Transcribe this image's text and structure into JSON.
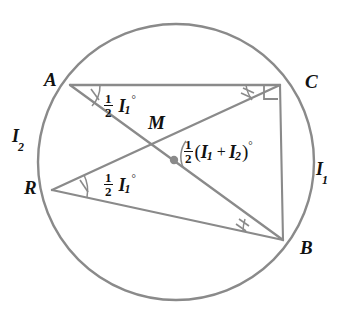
{
  "figure": {
    "background_color": "#ffffff",
    "stroke_color": "#8a8a8a",
    "text_color": "#111111",
    "circle": {
      "cx": 176,
      "cy": 162,
      "r": 138
    }
  },
  "points": {
    "A": {
      "label": "A",
      "x": 70,
      "y": 85,
      "label_x": 44,
      "label_y": 70
    },
    "C": {
      "label": "C",
      "x": 280,
      "y": 85,
      "label_x": 305,
      "label_y": 72
    },
    "R": {
      "label": "R",
      "x": 52,
      "y": 190,
      "label_x": 24,
      "label_y": 178
    },
    "B": {
      "label": "B",
      "x": 283,
      "y": 240,
      "label_x": 300,
      "label_y": 238
    },
    "M": {
      "label": "M",
      "x": 174,
      "y": 160,
      "label_x": 148,
      "label_y": 113
    }
  },
  "chords": [
    {
      "name": "chord-AC",
      "from": "A",
      "to": "C"
    },
    {
      "name": "chord-AB",
      "from": "A",
      "to": "B"
    },
    {
      "name": "chord-RC",
      "from": "R",
      "to": "C"
    },
    {
      "name": "chord-RB",
      "from": "R",
      "to": "B"
    },
    {
      "name": "chord-CB",
      "from": "C",
      "to": "B"
    }
  ],
  "labels": {
    "angle_A": {
      "text": "1/2 I1 degrees",
      "half_num": "1",
      "half_den": "2",
      "variable": "I",
      "subscript": "1",
      "degree": "°",
      "x": 104,
      "y": 99
    },
    "angle_R": {
      "text": "1/2 I1 degrees",
      "half_num": "1",
      "half_den": "2",
      "variable": "I",
      "subscript": "1",
      "degree": "°",
      "x": 104,
      "y": 178
    },
    "angle_M": {
      "text": "1/2 (I1 + I2) degrees",
      "half_num": "1",
      "half_den": "2",
      "open_paren": "(",
      "variable1": "I",
      "subscript1": "1",
      "plus": "+",
      "variable2": "I",
      "subscript2": "2",
      "close_paren": ")",
      "degree": "°",
      "x": 184,
      "y": 145
    },
    "arc_right": {
      "variable": "I",
      "subscript": "1",
      "x": 316,
      "y": 160
    },
    "arc_left": {
      "variable": "I",
      "subscript": "2",
      "x": 12,
      "y": 127
    }
  },
  "markers": {
    "right_angle_at_C": {
      "present": true,
      "size": 14
    },
    "single_tick_A": {
      "present": true,
      "count": 1
    },
    "single_tick_R": {
      "present": true,
      "count": 1
    },
    "double_tick_C": {
      "present": true,
      "count": 2
    },
    "double_tick_B": {
      "present": true,
      "count": 2
    },
    "center_dot_M": {
      "present": true,
      "radius": 4
    },
    "angle_arc_M": {
      "present": true
    }
  }
}
